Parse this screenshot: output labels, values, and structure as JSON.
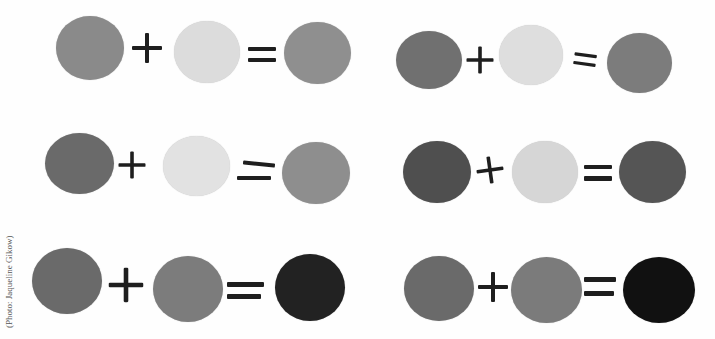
{
  "caption": {
    "credit": "(Photo: Jaqueline Gikow)"
  },
  "equations": [
    {
      "id": "row1-left",
      "colors": [
        "#8a8a8a",
        "#dcdcdc",
        "#8f8f8f"
      ]
    },
    {
      "id": "row1-right",
      "colors": [
        "#707070",
        "#dedede",
        "#7c7c7c"
      ]
    },
    {
      "id": "row2-left",
      "colors": [
        "#6a6a6a",
        "#e2e2e2",
        "#8e8e8e"
      ]
    },
    {
      "id": "row2-right",
      "colors": [
        "#4f4f4f",
        "#d6d6d6",
        "#555555"
      ]
    },
    {
      "id": "row3-left",
      "colors": [
        "#6a6a6a",
        "#7c7c7c",
        "#222222"
      ]
    },
    {
      "id": "row3-right",
      "colors": [
        "#6a6a6a",
        "#7b7b7b",
        "#111111"
      ]
    }
  ],
  "symbols": {
    "plus": "+",
    "equals": "="
  }
}
